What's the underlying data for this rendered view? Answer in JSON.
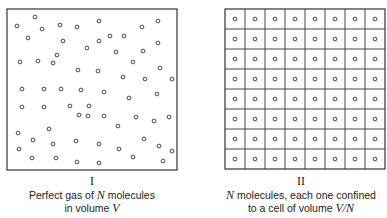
{
  "panels": [
    {
      "id": "I",
      "numeral": "I",
      "caption_line1_pre": "Perfect gas of ",
      "caption_line1_var": "N",
      "caption_line1_post": " molecules",
      "caption_line2_pre": "in volume ",
      "caption_line2_var": "V",
      "box": {
        "x": 7,
        "y": 9,
        "w": 170,
        "h": 161
      },
      "molecules": [
        [
          35,
          17
        ],
        [
          17,
          26
        ],
        [
          42,
          29
        ],
        [
          60,
          25
        ],
        [
          77,
          27
        ],
        [
          99,
          21
        ],
        [
          142,
          27
        ],
        [
          158,
          21
        ],
        [
          28,
          38
        ],
        [
          63,
          41
        ],
        [
          99,
          41
        ],
        [
          124,
          36
        ],
        [
          110,
          36
        ],
        [
          158,
          43
        ],
        [
          87,
          48
        ],
        [
          116,
          52
        ],
        [
          143,
          51
        ],
        [
          57,
          55
        ],
        [
          20,
          62
        ],
        [
          38,
          61
        ],
        [
          53,
          63
        ],
        [
          133,
          62
        ],
        [
          78,
          70
        ],
        [
          98,
          71
        ],
        [
          160,
          68
        ],
        [
          123,
          77
        ],
        [
          145,
          79
        ],
        [
          172,
          79
        ],
        [
          22,
          89
        ],
        [
          44,
          89
        ],
        [
          61,
          89
        ],
        [
          81,
          90
        ],
        [
          104,
          92
        ],
        [
          129,
          98
        ],
        [
          157,
          94
        ],
        [
          22,
          107
        ],
        [
          44,
          107
        ],
        [
          70,
          106
        ],
        [
          89,
          106
        ],
        [
          79,
          115
        ],
        [
          88,
          116
        ],
        [
          104,
          116
        ],
        [
          118,
          126
        ],
        [
          136,
          117
        ],
        [
          154,
          121
        ],
        [
          169,
          117
        ],
        [
          18,
          133
        ],
        [
          49,
          129
        ],
        [
          33,
          140
        ],
        [
          53,
          144
        ],
        [
          76,
          141
        ],
        [
          99,
          144
        ],
        [
          119,
          149
        ],
        [
          144,
          139
        ],
        [
          159,
          146
        ],
        [
          172,
          151
        ],
        [
          19,
          149
        ],
        [
          32,
          158
        ],
        [
          56,
          158
        ],
        [
          77,
          162
        ],
        [
          99,
          163
        ],
        [
          133,
          157
        ],
        [
          163,
          161
        ]
      ]
    },
    {
      "id": "II",
      "numeral": "II",
      "caption_line1_var": "N",
      "caption_line1_post": " molecules, each one confined",
      "caption_line2_pre": "to a cell of volume ",
      "caption_line2_var": "V/N",
      "grid": {
        "rows": 8,
        "cols": 8,
        "x": 225,
        "y": 9,
        "w": 160,
        "h": 160
      }
    }
  ]
}
